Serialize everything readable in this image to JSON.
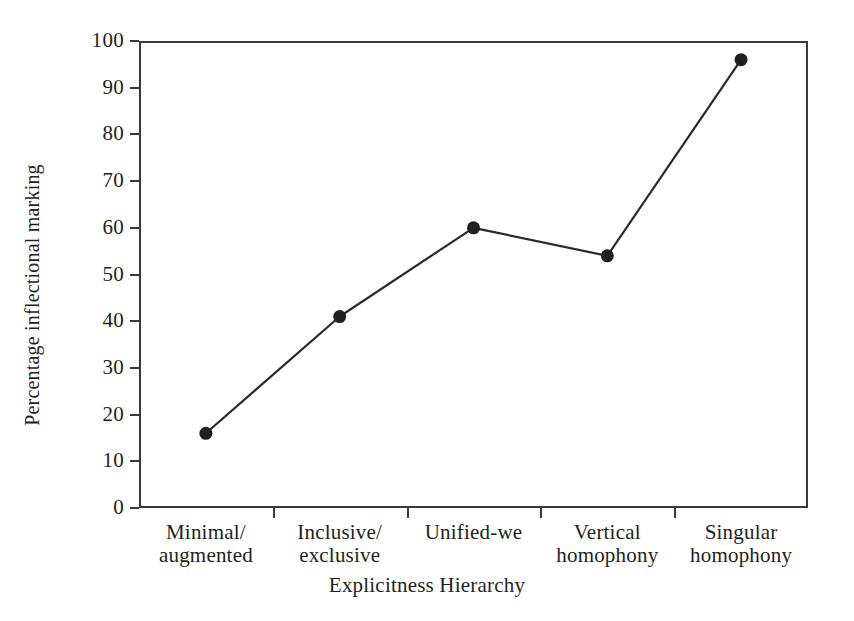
{
  "chart_data": {
    "type": "line",
    "title": "",
    "subtitle": "",
    "xlabel": "Explicitness Hierarchy",
    "ylabel": "Percentage inflectional marking",
    "categories": [
      "Minimal/\naugmented",
      "Inclusive/\nexclusive",
      "Unified-we",
      "Vertical\nhomophony",
      "Singular\nhomophony"
    ],
    "category_lines": [
      [
        "Minimal/",
        "augmented"
      ],
      [
        "Inclusive/",
        "exclusive"
      ],
      [
        "Unified-we",
        ""
      ],
      [
        "Vertical",
        "homophony"
      ],
      [
        "Singular",
        "homophony"
      ]
    ],
    "values": [
      16,
      41,
      60,
      54,
      96
    ],
    "ylim": [
      0,
      100
    ],
    "ytick_labels": [
      "0",
      "10",
      "20",
      "30",
      "40",
      "50",
      "60",
      "70",
      "80",
      "90",
      "100"
    ],
    "ytick_values": [
      0,
      10,
      20,
      30,
      40,
      50,
      60,
      70,
      80,
      90,
      100
    ],
    "grid": false,
    "legend": false,
    "legend_position": "none",
    "marker": "filled-circle",
    "line_color": "#2a2a2a",
    "marker_color": "#231f20",
    "axis_color": "#3a3a3a",
    "background_color": "#ffffff"
  }
}
